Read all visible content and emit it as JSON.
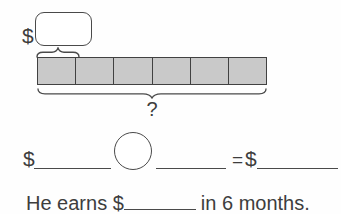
{
  "colors": {
    "background": "#fefefe",
    "line": "#4a4a4a",
    "text": "#3d3d3d",
    "bar_fill": "#c9c9c9",
    "bar_border": "#414141"
  },
  "diagram": {
    "unit_box": {
      "dollar_label": "$",
      "value": ""
    },
    "bar": {
      "segment_count": 6,
      "segments": [
        "",
        "",
        "",
        "",
        "",
        ""
      ],
      "total_label": "?"
    }
  },
  "equation": {
    "dollar_left": "$",
    "blank_left": "",
    "operation_value": "",
    "blank_right": "",
    "equals_sign": "=",
    "dollar_right": "$",
    "blank_result": ""
  },
  "sentence": {
    "prefix": "He earns $",
    "blank_value": "",
    "suffix": "in 6 months."
  }
}
